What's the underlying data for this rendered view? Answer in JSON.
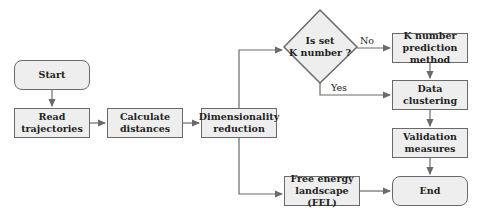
{
  "diagram": {
    "type": "flowchart",
    "nodes": {
      "start": "Start",
      "read": "Read\ntrajectories",
      "calc": "Calculate\ndistances",
      "dimred": "Dimensionality\nreduction",
      "decision": "Is set\nK number ?",
      "kpred": "K number\nprediction method",
      "cluster": "Data\nclustering",
      "valid": "Validation\nmeasures",
      "end": "End",
      "fel": "Free energy\nlandscape (FEL)"
    },
    "edge_labels": {
      "no": "No",
      "yes": "Yes"
    },
    "colors": {
      "box_fill": "#eeeeee",
      "stroke": "#6a6a6a",
      "text": "#222222"
    }
  }
}
